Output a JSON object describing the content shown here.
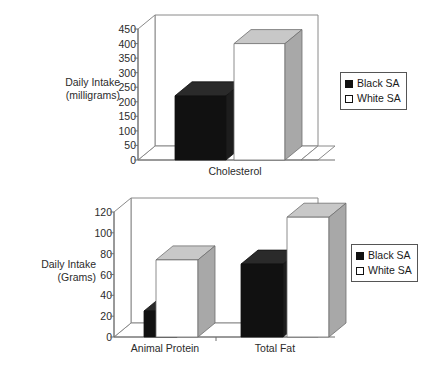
{
  "charts": [
    {
      "id": "cholesterol-chart",
      "axis_title_line1": "Daily Intake",
      "axis_title_line2": "(milligrams)",
      "ylabel": "Daily Intake (milligrams)",
      "categories": [
        "Cholesterol"
      ],
      "yticks": [
        "0",
        "50",
        "100",
        "150",
        "200",
        "250",
        "300",
        "350",
        "400",
        "450"
      ],
      "legend": [
        {
          "label": "Black SA",
          "swatch": "black"
        },
        {
          "label": "White SA",
          "swatch": "white"
        }
      ]
    },
    {
      "id": "protein-fat-chart",
      "axis_title_line1": "Daily Intake",
      "axis_title_line2": "(Grams)",
      "ylabel": "Daily Intake (Grams)",
      "categories": [
        "Animal Protein",
        "Total Fat"
      ],
      "yticks": [
        "0",
        "20",
        "40",
        "60",
        "80",
        "100",
        "120"
      ],
      "legend": [
        {
          "label": "Black SA",
          "swatch": "black"
        },
        {
          "label": "White SA",
          "swatch": "white"
        }
      ]
    }
  ],
  "chart_data": [
    {
      "type": "bar",
      "title": "",
      "xlabel": "",
      "ylabel": "Daily Intake (milligrams)",
      "categories": [
        "Cholesterol"
      ],
      "series": [
        {
          "name": "Black SA",
          "values": [
            220
          ]
        },
        {
          "name": "White SA",
          "values": [
            400
          ]
        }
      ],
      "ylim": [
        0,
        450
      ],
      "ytick_step": 50,
      "yticks": [
        0,
        50,
        100,
        150,
        200,
        250,
        300,
        350,
        400,
        450
      ],
      "grid": false,
      "legend_position": "right",
      "three_d": true,
      "colors": {
        "Black SA": "#111111",
        "White SA": "#ffffff"
      }
    },
    {
      "type": "bar",
      "title": "",
      "xlabel": "",
      "ylabel": "Daily Intake (Grams)",
      "categories": [
        "Animal Protein",
        "Total Fat"
      ],
      "series": [
        {
          "name": "Black SA",
          "values": [
            25,
            70
          ]
        },
        {
          "name": "White SA",
          "values": [
            75,
            115
          ]
        }
      ],
      "ylim": [
        0,
        120
      ],
      "ytick_step": 20,
      "yticks": [
        0,
        20,
        40,
        60,
        80,
        100,
        120
      ],
      "grid": false,
      "legend_position": "right",
      "three_d": true,
      "colors": {
        "Black SA": "#111111",
        "White SA": "#ffffff"
      }
    }
  ],
  "colors": {
    "bar_black_front": "#111111",
    "bar_black_top": "#2a2a2a",
    "bar_black_side": "#1d1d1d",
    "bar_white_front": "#ffffff",
    "bar_white_top": "#c8c8c8",
    "bar_white_side": "#a8a8a8",
    "frame": "#8a8a8a",
    "text": "#2b2b2b"
  }
}
